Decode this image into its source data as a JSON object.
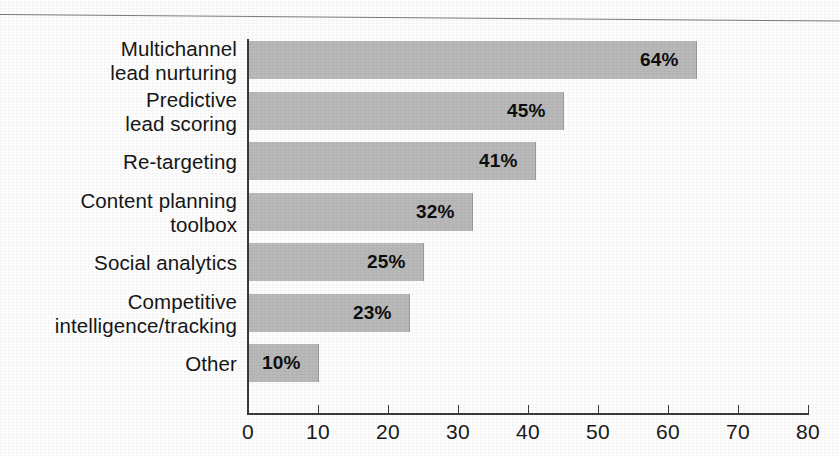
{
  "figure": {
    "caption_fragment": "",
    "background_color": "#fdfdfd",
    "bar_color": "#b9b9b9",
    "axis_color": "#3a3a3a",
    "text_color": "#161616"
  },
  "chart_data": {
    "type": "bar",
    "orientation": "horizontal",
    "title": "",
    "xlabel": "",
    "ylabel": "",
    "categories": [
      "Multichannel\nlead nurturing",
      "Predictive\nlead scoring",
      "Re-targeting",
      "Content planning\ntoolbox",
      "Social analytics",
      "Competitive\nintelligence/tracking",
      "Other"
    ],
    "values": [
      64,
      45,
      41,
      32,
      25,
      23,
      10
    ],
    "value_labels": [
      "64%",
      "45%",
      "41%",
      "32%",
      "25%",
      "23%",
      "10%"
    ],
    "xlim": [
      0,
      80
    ],
    "xticks": [
      0,
      10,
      20,
      30,
      40,
      50,
      60,
      70,
      80
    ],
    "xtick_labels": [
      "0",
      "10",
      "20",
      "30",
      "40",
      "50",
      "60",
      "70",
      "80"
    ],
    "grid": false,
    "legend": false,
    "series": [
      {
        "name": "",
        "values": [
          64,
          45,
          41,
          32,
          25,
          23,
          10
        ]
      }
    ]
  }
}
